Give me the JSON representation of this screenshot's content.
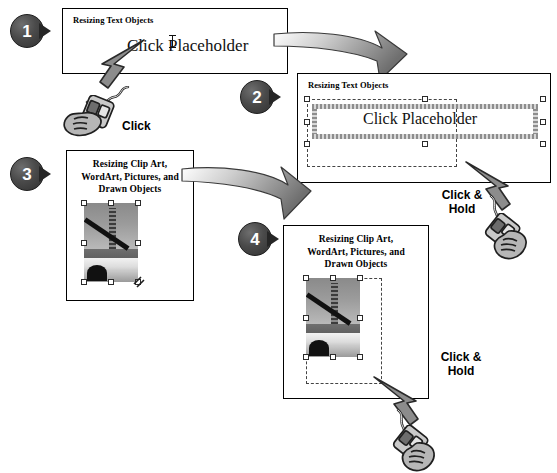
{
  "figure": {
    "background_color": "#ffffff",
    "badge_color": "#3a3a3a",
    "badge_text_color": "#ffffff"
  },
  "steps": [
    {
      "number": "1",
      "panel_title": "Resizing Text Objects",
      "body_text": "Click Placeholder",
      "caption": "Click"
    },
    {
      "number": "2",
      "panel_title": "Resizing Text Objects",
      "body_text": "Click Placeholder",
      "caption_line1": "Click &",
      "caption_line2": "Hold"
    },
    {
      "number": "3",
      "panel_title_line1": "Resizing Clip Art,",
      "panel_title_line2": "WordArt, Pictures, and",
      "panel_title_line3": "Drawn Objects"
    },
    {
      "number": "4",
      "panel_title_line1": "Resizing Clip Art,",
      "panel_title_line2": "WordArt, Pictures, and",
      "panel_title_line3": "Drawn Objects",
      "caption_line1": "Click &",
      "caption_line2": "Hold"
    }
  ],
  "icons": {
    "mouse": "mouse-hand-icon",
    "pointer": "arrow-pointer-icon",
    "swoosh": "curved-arrow-icon",
    "ibeam": "text-cursor-icon",
    "resize_handle": "selection-handle-icon",
    "picture": "bridge-photo-icon"
  }
}
